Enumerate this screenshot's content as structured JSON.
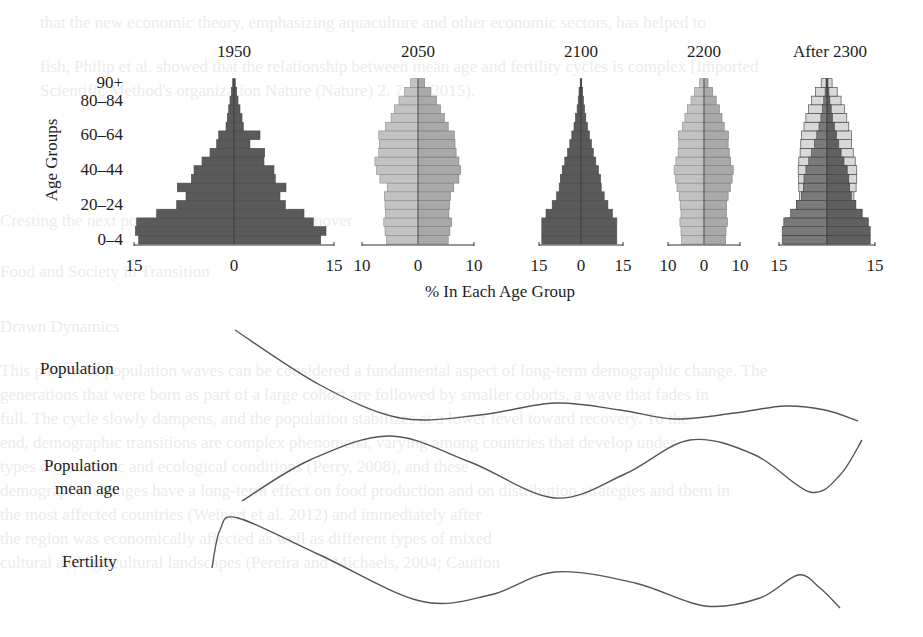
{
  "figure": {
    "y_axis_title": "Age Groups",
    "x_axis_title": "% In Each Age Group",
    "age_tick_labels": [
      {
        "label": "90+",
        "group_index": 18
      },
      {
        "label": "80–84",
        "group_index": 16
      },
      {
        "label": "60–64",
        "group_index": 12
      },
      {
        "label": "40–44",
        "group_index": 8
      },
      {
        "label": "20–24",
        "group_index": 4
      },
      {
        "label": "0–4",
        "group_index": 0
      }
    ],
    "curve_labels": {
      "population": "Population",
      "mean_age_line1": "Population",
      "mean_age_line2": "mean age",
      "fertility": "Fertility"
    }
  },
  "colors": {
    "dark_bar": "#5a5a5a",
    "light_bar_left": "#c2c2c2",
    "light_bar_right": "#a9a9a9",
    "after_dark_left": "#7a7a7a",
    "after_dark_right": "#606060",
    "after_outline_fill": "#d8d8d8",
    "axis": "#333333",
    "curve": "#555555",
    "bar_edge": "#3a3a3a"
  },
  "chart_data": [
    {
      "type": "bar",
      "subtype": "population-pyramid",
      "title": "1950",
      "xlabel": "% In Each Age Group",
      "ylabel": "Age Groups",
      "x_tick_labels": [
        "15",
        "0",
        "15"
      ],
      "xlim": [
        -15,
        15
      ],
      "categories": [
        "0–4",
        "5–9",
        "10–14",
        "15–19",
        "20–24",
        "25–29",
        "30–34",
        "35–39",
        "40–44",
        "45–49",
        "50–54",
        "55–59",
        "60–64",
        "65–69",
        "70–74",
        "75–79",
        "80–84",
        "85–89",
        "90+"
      ],
      "series": [
        {
          "name": "left",
          "values": [
            14.3,
            14.8,
            14.6,
            11.6,
            8.6,
            7.2,
            8.5,
            6.4,
            6.0,
            4.8,
            3.6,
            2.6,
            2.3,
            1.2,
            1.0,
            0.8,
            0.6,
            0.4,
            0.2
          ]
        },
        {
          "name": "right",
          "values": [
            13.0,
            13.8,
            11.9,
            10.5,
            7.7,
            6.9,
            7.8,
            6.2,
            6.0,
            4.5,
            4.6,
            2.4,
            3.9,
            1.4,
            1.2,
            0.9,
            0.6,
            0.4,
            0.2
          ]
        }
      ],
      "style": "dark"
    },
    {
      "type": "bar",
      "subtype": "population-pyramid",
      "title": "2050",
      "x_tick_labels": [
        "10",
        "0",
        "10"
      ],
      "xlim": [
        -10,
        10
      ],
      "categories": [
        "0–4",
        "5–9",
        "10–14",
        "15–19",
        "20–24",
        "25–29",
        "30–34",
        "35–39",
        "40–44",
        "45–49",
        "50–54",
        "55–59",
        "60–64",
        "65–69",
        "70–74",
        "75–79",
        "80–84",
        "85–89",
        "90+"
      ],
      "series": [
        {
          "name": "left",
          "values": [
            5.6,
            5.9,
            6.1,
            5.8,
            5.9,
            6.0,
            5.5,
            6.8,
            7.4,
            7.7,
            7.0,
            6.9,
            7.0,
            5.8,
            4.8,
            4.2,
            3.4,
            2.4,
            1.3
          ]
        },
        {
          "name": "right",
          "values": [
            5.4,
            5.7,
            6.0,
            5.5,
            5.6,
            5.8,
            6.4,
            7.3,
            7.6,
            7.3,
            6.8,
            6.6,
            6.5,
            5.4,
            4.7,
            4.0,
            3.3,
            2.3,
            1.2
          ]
        }
      ],
      "style": "light"
    },
    {
      "type": "bar",
      "subtype": "population-pyramid",
      "title": "2100",
      "x_tick_labels": [
        "15",
        "0",
        "15"
      ],
      "xlim": [
        -15,
        15
      ],
      "categories": [
        "0–4",
        "5–9",
        "10–14",
        "15–19",
        "20–24",
        "25–29",
        "30–34",
        "35–39",
        "40–44",
        "45–49",
        "50–54",
        "55–59",
        "60–64",
        "65–69",
        "70–74",
        "75–79",
        "80–84",
        "85–89",
        "90+"
      ],
      "series": [
        {
          "name": "left",
          "values": [
            14.0,
            14.0,
            14.0,
            12.5,
            10.3,
            8.7,
            7.8,
            7.4,
            6.7,
            5.8,
            4.8,
            4.0,
            3.3,
            2.5,
            2.0,
            1.4,
            1.0,
            0.7,
            0.3
          ]
        },
        {
          "name": "right",
          "values": [
            12.8,
            12.8,
            12.8,
            11.2,
            9.6,
            8.3,
            7.2,
            7.0,
            6.3,
            5.3,
            4.4,
            3.7,
            3.0,
            2.3,
            1.7,
            1.3,
            0.9,
            0.6,
            0.3
          ]
        }
      ],
      "style": "dark"
    },
    {
      "type": "bar",
      "subtype": "population-pyramid",
      "title": "2200",
      "x_tick_labels": [
        "10",
        "0",
        "10"
      ],
      "xlim": [
        -10,
        10
      ],
      "categories": [
        "0–4",
        "5–9",
        "10–14",
        "15–19",
        "20–24",
        "25–29",
        "30–34",
        "35–39",
        "40–44",
        "45–49",
        "50–54",
        "55–59",
        "60–64",
        "65–69",
        "70–74",
        "75–79",
        "80–84",
        "85–89",
        "90+"
      ],
      "series": [
        {
          "name": "left",
          "values": [
            6.2,
            6.4,
            6.7,
            6.4,
            6.6,
            6.9,
            7.5,
            7.9,
            8.3,
            7.8,
            7.2,
            7.0,
            7.1,
            6.0,
            5.3,
            4.6,
            3.6,
            2.6,
            1.2
          ]
        },
        {
          "name": "right",
          "values": [
            6.0,
            6.1,
            6.5,
            6.2,
            6.3,
            6.7,
            7.3,
            7.8,
            8.1,
            7.4,
            7.0,
            6.7,
            6.8,
            5.6,
            5.0,
            4.3,
            3.4,
            2.4,
            1.1
          ]
        }
      ],
      "style": "light"
    },
    {
      "type": "bar",
      "subtype": "population-pyramid-overlay",
      "title": "After 2300",
      "x_tick_labels": [
        "15",
        "15"
      ],
      "xlim": [
        -15,
        15
      ],
      "categories": [
        "0–4",
        "5–9",
        "10–14",
        "15–19",
        "20–24",
        "25–29",
        "30–34",
        "35–39",
        "40–44",
        "45–49",
        "50–54",
        "55–59",
        "60–64",
        "65–69",
        "70–74",
        "75–79",
        "80–84",
        "85–89",
        "90+"
      ],
      "series": [
        {
          "name": "inner-left",
          "values": [
            14.0,
            14.0,
            13.5,
            11.4,
            9.5,
            8.0,
            7.4,
            7.2,
            6.6,
            5.7,
            4.8,
            3.9,
            3.2,
            2.5,
            1.9,
            1.4,
            1.0,
            0.6,
            0.3
          ]
        },
        {
          "name": "inner-right",
          "values": [
            13.5,
            13.5,
            12.9,
            11.0,
            9.0,
            7.6,
            7.1,
            6.8,
            6.3,
            5.3,
            4.4,
            3.7,
            3.0,
            2.3,
            1.7,
            1.3,
            0.9,
            0.6,
            0.3
          ]
        },
        {
          "name": "outline-left",
          "values": [
            13.5,
            13.5,
            13.0,
            11.0,
            9.5,
            8.6,
            8.8,
            8.9,
            9.0,
            8.8,
            8.4,
            8.2,
            8.0,
            7.2,
            6.6,
            5.8,
            4.8,
            3.6,
            1.8
          ]
        },
        {
          "name": "outline-right",
          "values": [
            13.0,
            13.0,
            12.5,
            10.5,
            9.0,
            8.4,
            9.1,
            9.3,
            9.3,
            8.8,
            8.2,
            7.7,
            7.6,
            6.8,
            6.2,
            5.4,
            4.4,
            3.2,
            1.6
          ]
        }
      ],
      "style": "overlay"
    },
    {
      "type": "line",
      "subtype": "schematic-wave",
      "title": "Population",
      "points": [
        [
          235,
          330
        ],
        [
          320,
          385
        ],
        [
          400,
          418
        ],
        [
          480,
          415
        ],
        [
          555,
          403
        ],
        [
          620,
          410
        ],
        [
          675,
          419
        ],
        [
          735,
          413
        ],
        [
          785,
          406
        ],
        [
          825,
          410
        ],
        [
          858,
          421
        ]
      ]
    },
    {
      "type": "line",
      "subtype": "schematic-wave",
      "title": "Population mean age",
      "points": [
        [
          242,
          501
        ],
        [
          310,
          460
        ],
        [
          390,
          436
        ],
        [
          470,
          462
        ],
        [
          555,
          498
        ],
        [
          625,
          474
        ],
        [
          690,
          440
        ],
        [
          755,
          455
        ],
        [
          810,
          492
        ],
        [
          840,
          475
        ],
        [
          862,
          440
        ]
      ]
    },
    {
      "type": "line",
      "subtype": "schematic-wave",
      "title": "Fertility",
      "points": [
        [
          212,
          568
        ],
        [
          220,
          530
        ],
        [
          238,
          518
        ],
        [
          320,
          555
        ],
        [
          420,
          601
        ],
        [
          490,
          595
        ],
        [
          555,
          572
        ],
        [
          635,
          583
        ],
        [
          705,
          606
        ],
        [
          760,
          598
        ],
        [
          798,
          575
        ],
        [
          820,
          588
        ],
        [
          840,
          608
        ]
      ]
    }
  ],
  "layout": {
    "pyramids": [
      {
        "cx": 234,
        "half_width": 100,
        "title_x": 234
      },
      {
        "cx": 418,
        "half_width": 56,
        "title_x": 418
      },
      {
        "cx": 581,
        "half_width": 42,
        "title_x": 581
      },
      {
        "cx": 704,
        "half_width": 36,
        "title_x": 704
      },
      {
        "cx": 827,
        "half_width": 48,
        "title_x": 830
      }
    ],
    "baseline_y": 244,
    "bar_height": 8.7,
    "title_y": 57,
    "tick_y": 271
  },
  "background_bleed_lines": [
    {
      "x": 40,
      "y": 12,
      "text": "that the new economic theory, emphasizing aquaculture and other economic sectors, has helped to"
    },
    {
      "x": 40,
      "y": 56,
      "text": "fish, Philip et al. showed that the relationship between mean age and fertility cycles is complex [Imported"
    },
    {
      "x": 40,
      "y": 80,
      "text": "Scientific Method's organization Nature (Nature) 2. 7-9). 2015)."
    },
    {
      "x": 0,
      "y": 210,
      "text": "Cresting the next population and mean age turnover"
    },
    {
      "x": 0,
      "y": 261,
      "text": "Food and Society in Transition"
    },
    {
      "x": 0,
      "y": 316,
      "text": "Drawn Dynamics"
    },
    {
      "x": 0,
      "y": 360,
      "text": "This pattern of population waves can be considered a fundamental aspect of long-term demographic change. The"
    },
    {
      "x": 0,
      "y": 384,
      "text": "generations that were born as part of a large cohort are followed by smaller cohorts, a wave that fades in"
    },
    {
      "x": 0,
      "y": 408,
      "text": "full. The cycle slowly dampens, and the population stabilizes at a lower level toward recovery. To the"
    },
    {
      "x": 0,
      "y": 432,
      "text": "end, demographic transitions are complex phenomena, varying among countries that develop under"
    },
    {
      "x": 0,
      "y": 456,
      "text": "types of economic and ecological conditions (Perry, 2008), and these"
    },
    {
      "x": 0,
      "y": 480,
      "text": "demographic changes have a long-term effect on food production and on distribution strategies and them in"
    },
    {
      "x": 0,
      "y": 504,
      "text": "the most affected countries (Weinert et al. 2012) and immediately after"
    },
    {
      "x": 0,
      "y": 528,
      "text": "the region was economically affected as well as different types of mixed"
    },
    {
      "x": 0,
      "y": 552,
      "text": "cultural and agricultural landscapes (Pereira and Michaels, 2004; Caution"
    }
  ]
}
